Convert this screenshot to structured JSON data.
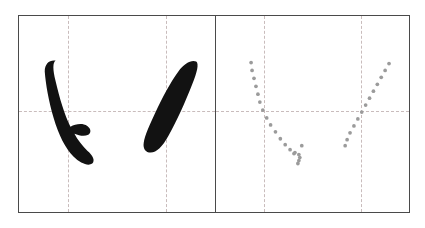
{
  "figure": {
    "background_color": "#ffffff",
    "frame_color": "#4a4a4a",
    "guide_color": "#c9bcbc",
    "ink_color": "#121212",
    "trace_dot_color": "#9b9b9b",
    "panel_count": 4,
    "group_count": 2
  },
  "groups": [
    {
      "name": "solid-ink-group",
      "render_mode": "solid",
      "label": ""
    },
    {
      "name": "dotted-trace-group",
      "render_mode": "dotted",
      "label": ""
    }
  ],
  "panels": [
    {
      "id": "panel-1",
      "group": "solid-ink-group",
      "position": "left",
      "stroke_name": "shu-wan-gou",
      "render_mode": "solid",
      "label": "",
      "guides": {
        "horizontal": true,
        "vertical": true
      }
    },
    {
      "id": "panel-2",
      "group": "solid-ink-group",
      "position": "right",
      "stroke_name": "pie",
      "render_mode": "solid",
      "label": "",
      "guides": {
        "horizontal": true,
        "vertical": true
      }
    },
    {
      "id": "panel-3",
      "group": "dotted-trace-group",
      "position": "left",
      "stroke_name": "shu-wan-gou",
      "render_mode": "dotted",
      "label": "",
      "guides": {
        "horizontal": true,
        "vertical": true
      }
    },
    {
      "id": "panel-4",
      "group": "dotted-trace-group",
      "position": "right",
      "stroke_name": "pie",
      "render_mode": "dotted",
      "label": "",
      "guides": {
        "horizontal": true,
        "vertical": true
      }
    }
  ],
  "strokes": {
    "shu_wan_gou": {
      "name": "shu-wan-gou",
      "description": "vertical stroke curving to lower-right with an upward hook",
      "solid_outline_path": "M 38 46 C 33 44 27 47 26 53 C 25 62 28 78 32 94 C 36 110 41 124 47 133 C 52 141 59 147 66 149 C 71 150 74 148 74 145 C 74 141 70 138 65 134 C 61 131 57 127 54 122 L 61 122 C 66 122 70 120 70 117 C 70 114 66 111 61 110 C 56 109 51 111 48 113 C 44 105 41 95 38 84 C 34 69 32 57 33 51 C 34 47 38 46 38 46 Z",
      "solid_ink_path": "M 37 45 C 31 44 26 48 26 56 C 27 69 30 86 35 103 C 40 120 47 134 55 142 C 62 149 70 152 74 149 C 77 146 75 141 69 136 C 64 131 59 125 56 119 C 61 121 66 122 70 120 C 73 118 73 114 69 111 C 64 108 57 109 52 112 C 46 100 41 83 37 66 C 34 54 34 47 37 45 Z",
      "trace_points": [
        {
          "x": 36,
          "y": 47
        },
        {
          "x": 37,
          "y": 55
        },
        {
          "x": 39,
          "y": 63
        },
        {
          "x": 41,
          "y": 71
        },
        {
          "x": 43,
          "y": 79
        },
        {
          "x": 45,
          "y": 87
        },
        {
          "x": 48,
          "y": 95
        },
        {
          "x": 52,
          "y": 103
        },
        {
          "x": 56,
          "y": 110
        },
        {
          "x": 61,
          "y": 117
        },
        {
          "x": 66,
          "y": 124
        },
        {
          "x": 71,
          "y": 130
        },
        {
          "x": 76,
          "y": 135
        },
        {
          "x": 81,
          "y": 138
        },
        {
          "x": 85,
          "y": 140
        },
        {
          "x": 86,
          "y": 143
        },
        {
          "x": 85,
          "y": 146
        },
        {
          "x": 84,
          "y": 149
        },
        {
          "x": 80,
          "y": 139
        },
        {
          "x": 88,
          "y": 131
        }
      ]
    },
    "pie": {
      "name": "pie",
      "description": "tapered diagonal stroke from upper-right to lower-left",
      "solid_ink_path": "M 80 46 C 75 44 68 48 62 56 C 54 67 46 82 39 97 C 33 110 28 121 27 128 C 26 134 29 138 34 138 C 40 138 46 132 52 121 C 60 107 69 87 76 69 C 81 57 83 48 80 46 Z",
      "trace_points": [
        {
          "x": 78,
          "y": 48
        },
        {
          "x": 74,
          "y": 55
        },
        {
          "x": 70,
          "y": 62
        },
        {
          "x": 66,
          "y": 69
        },
        {
          "x": 62,
          "y": 76
        },
        {
          "x": 58,
          "y": 83
        },
        {
          "x": 54,
          "y": 90
        },
        {
          "x": 50,
          "y": 97
        },
        {
          "x": 46,
          "y": 104
        },
        {
          "x": 42,
          "y": 111
        },
        {
          "x": 38,
          "y": 118
        },
        {
          "x": 35,
          "y": 125
        },
        {
          "x": 33,
          "y": 131
        }
      ]
    }
  },
  "geometry": {
    "panel_width": 99,
    "panel_height": 198,
    "guide_h_ratio": 0.49,
    "guide_v_ratio": 0.5,
    "dot_radius": 1.9
  }
}
